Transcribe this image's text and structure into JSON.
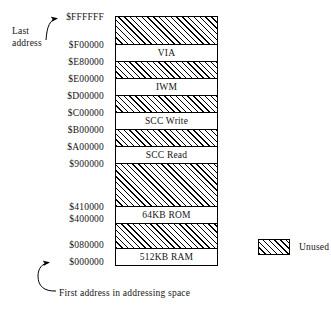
{
  "figure": {
    "type": "memory-map",
    "callouts": {
      "last_address": "Last address",
      "first_address": "First address in addressing space"
    },
    "legend": {
      "swatch_pattern": "diagonal-hatch",
      "label": "Unused"
    },
    "colors": {
      "ink": "#000000",
      "paper": "#ffffff",
      "hatch": "#000000"
    },
    "address_labels": [
      {
        "text": "$FFFFFF",
        "top": 12
      },
      {
        "text": "$F00000",
        "top": 40
      },
      {
        "text": "$E80000",
        "top": 57
      },
      {
        "text": "$E00000",
        "top": 74
      },
      {
        "text": "$D00000",
        "top": 91
      },
      {
        "text": "$C00000",
        "top": 108
      },
      {
        "text": "$B00000",
        "top": 125
      },
      {
        "text": "$A00000",
        "top": 142
      },
      {
        "text": "$900000",
        "top": 159
      },
      {
        "text": "$410000",
        "top": 202
      },
      {
        "text": "$400000",
        "top": 214
      },
      {
        "text": "$080000",
        "top": 240
      },
      {
        "text": "$000000",
        "top": 257
      }
    ],
    "segments": [
      {
        "label": "",
        "kind": "unused",
        "top": 0,
        "height": 29,
        "start": "$F00000",
        "end": "$FFFFFF"
      },
      {
        "label": "VIA",
        "kind": "used",
        "top": 28,
        "height": 18,
        "start": "$E80000",
        "end": "$F00000"
      },
      {
        "label": "",
        "kind": "unused",
        "top": 45,
        "height": 18,
        "start": "$E00000",
        "end": "$E80000"
      },
      {
        "label": "IWM",
        "kind": "used",
        "top": 62,
        "height": 18,
        "start": "$D00000",
        "end": "$E00000"
      },
      {
        "label": "",
        "kind": "unused",
        "top": 79,
        "height": 18,
        "start": "$C00000",
        "end": "$D00000"
      },
      {
        "label": "SCC Write",
        "kind": "used",
        "top": 96,
        "height": 18,
        "start": "$B00000",
        "end": "$C00000"
      },
      {
        "label": "",
        "kind": "unused",
        "top": 113,
        "height": 18,
        "start": "$A00000",
        "end": "$B00000"
      },
      {
        "label": "SCC Read",
        "kind": "used",
        "top": 130,
        "height": 18,
        "start": "$900000",
        "end": "$A00000"
      },
      {
        "label": "",
        "kind": "unused",
        "top": 147,
        "height": 44,
        "start": "$410000",
        "end": "$900000"
      },
      {
        "label": "64KB ROM",
        "kind": "used",
        "top": 190,
        "height": 18,
        "start": "$400000",
        "end": "$410000"
      },
      {
        "label": "",
        "kind": "unused",
        "top": 207,
        "height": 26,
        "start": "$080000",
        "end": "$400000"
      },
      {
        "label": "512KB RAM",
        "kind": "used",
        "top": 232,
        "height": 18,
        "start": "$000000",
        "end": "$080000"
      }
    ]
  },
  "chart_data": {
    "type": "bar",
    "title": "",
    "xlabel": "",
    "ylabel": "Address",
    "categories": [
      "Unused (top)",
      "VIA",
      "Unused",
      "IWM",
      "Unused",
      "SCC Write",
      "Unused",
      "SCC Read",
      "Unused",
      "64KB ROM",
      "Unused",
      "512KB RAM"
    ],
    "values": [
      29,
      18,
      18,
      18,
      18,
      18,
      18,
      18,
      44,
      18,
      26,
      18
    ],
    "tick_labels": [
      "$FFFFFF",
      "$F00000",
      "$E80000",
      "$E00000",
      "$D00000",
      "$C00000",
      "$B00000",
      "$A00000",
      "$900000",
      "$410000",
      "$400000",
      "$080000",
      "$000000"
    ],
    "legend": [
      "Unused"
    ],
    "legend_position": "right",
    "grid": false
  }
}
